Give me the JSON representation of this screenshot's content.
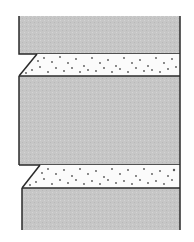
{
  "diagram": {
    "colors": {
      "block": "#c8c8c8",
      "band": "#fbfbfb",
      "stroke": "#2a2a2a",
      "dot": "#555555"
    },
    "layers": [
      {
        "type": "block",
        "name": "top-block"
      },
      {
        "type": "band",
        "name": "upper-sand-band"
      },
      {
        "type": "block",
        "name": "middle-block"
      },
      {
        "type": "band",
        "name": "lower-sand-band"
      },
      {
        "type": "block",
        "name": "bottom-block"
      }
    ]
  }
}
